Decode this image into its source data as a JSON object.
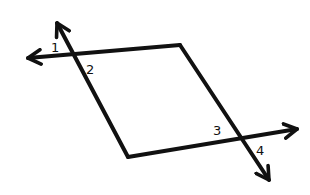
{
  "diagram": {
    "type": "parallelogram with two transversal lines and numbered angles",
    "stroke_color": "#111111",
    "background": "#ffffff",
    "angle_labels": [
      {
        "id": "1",
        "text": "1",
        "x": 54,
        "y": 52
      },
      {
        "id": "2",
        "text": "2",
        "x": 87,
        "y": 73
      },
      {
        "id": "3",
        "text": "3",
        "x": 214,
        "y": 135
      },
      {
        "id": "4",
        "text": "4",
        "x": 257,
        "y": 155
      }
    ]
  }
}
